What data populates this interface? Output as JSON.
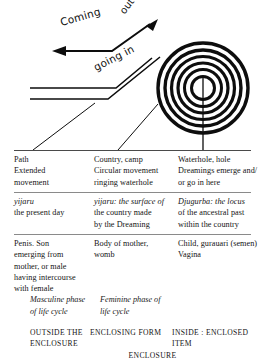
{
  "figure": {
    "labels": {
      "coming": "Coming",
      "out": "out",
      "going_in": "going in"
    },
    "icon_names": {
      "spiral": "concentric-circles-waterhole-icon",
      "arrow": "path-arrow-icon",
      "track": "travelling-path-lines-icon"
    }
  },
  "table": {
    "columns": [
      {
        "id": "outside",
        "meaning": [
          "Path",
          "Extended",
          "movement"
        ],
        "term": [
          "yijaru",
          "the present day"
        ],
        "bodily": [
          "Penis. Son",
          "emerging from",
          "mother, or male",
          "having intercourse",
          "with female"
        ],
        "phase": [
          "Masculine phase",
          "of life cycle"
        ],
        "caption": [
          "OUTSIDE THE",
          "ENCLOSURE"
        ]
      },
      {
        "id": "enclosing",
        "meaning": [
          "Country, camp",
          "Circular movement",
          "ringing waterhole"
        ],
        "term": [
          "yijaru: the surface of",
          "the country made",
          "by the Dreaming"
        ],
        "bodily": [
          "Body of mother,",
          "womb"
        ],
        "phase": [
          "Feminine phase of",
          "life cycle"
        ],
        "caption": [
          "ENCLOSING FORM"
        ]
      },
      {
        "id": "inside",
        "meaning": [
          "Waterhole, hole",
          "Dreamings emerge and/",
          "or go in here"
        ],
        "term": [
          "Djugurba: the locus",
          "of the ancestral past",
          "within the country"
        ],
        "bodily": [
          "Child, gurauari (semen)",
          "Vagina"
        ],
        "phase": [],
        "caption": [
          "INSIDE : ENCLOSED",
          "ITEM"
        ]
      }
    ],
    "enclosure_word": "ENCLOSURE"
  }
}
